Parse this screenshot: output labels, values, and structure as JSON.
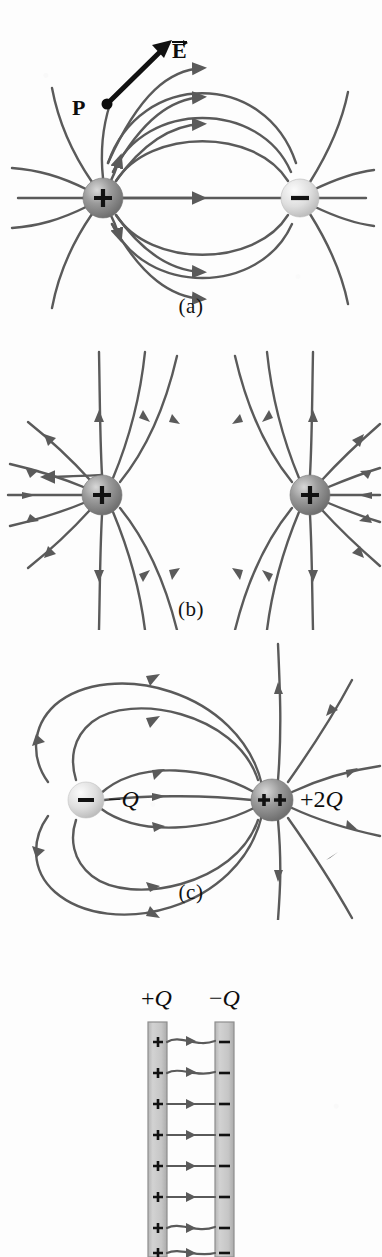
{
  "figure": {
    "background_color": "#fdfdfd",
    "field_line_color": "#5a5a5a",
    "label_color": "#0d0d0d"
  },
  "panels": [
    {
      "id": "a",
      "caption": "(a)",
      "description": "Electric dipole: equal and opposite point charges",
      "charges": [
        {
          "symbol": "+",
          "sign": "positive",
          "fill": "#8c8c8c",
          "x": 103,
          "y": 198,
          "r": 20
        },
        {
          "symbol": "−",
          "sign": "negative",
          "fill": "#d4d4d4",
          "x": 300,
          "y": 198,
          "r": 19
        }
      ],
      "annotations": [
        {
          "name": "point-P",
          "label": "P",
          "x": 80,
          "y": 108
        },
        {
          "name": "vector-E",
          "label": "E",
          "vector": true,
          "x": 176,
          "y": 45
        }
      ]
    },
    {
      "id": "b",
      "caption": "(b)",
      "description": "Two equal positive point charges",
      "charges": [
        {
          "symbol": "+",
          "sign": "positive",
          "fill": "#8c8c8c",
          "x": 102,
          "y": 495,
          "r": 20
        },
        {
          "symbol": "+",
          "sign": "positive",
          "fill": "#8c8c8c",
          "x": 310,
          "y": 495,
          "r": 20
        }
      ],
      "annotations": []
    },
    {
      "id": "c",
      "caption": "(c)",
      "description": "Unequal opposite charges: minus Q and plus two Q",
      "charges": [
        {
          "symbol": "−",
          "sign": "negative",
          "fill": "#e0e0e0",
          "x": 86,
          "y": 800,
          "r": 18
        },
        {
          "symbol": "++",
          "sign": "positive",
          "fill": "#6e6e6e",
          "x": 272,
          "y": 800,
          "r": 21
        }
      ],
      "annotations": [
        {
          "name": "charge-label-minus-q",
          "sign": "−",
          "value": "Q",
          "x": 110,
          "y": 786
        },
        {
          "name": "charge-label-plus-2q",
          "sign": "+2",
          "value": "Q",
          "x": 300,
          "y": 786
        }
      ]
    },
    {
      "id": "d",
      "caption": "",
      "description": "Parallel plate capacitor with oppositely charged plates",
      "plates": [
        {
          "name": "positive-plate",
          "label_sign": "+",
          "label_value": "Q",
          "sign_symbol": "+",
          "x": 148,
          "width": 19,
          "top": 1022,
          "fill": "#c9c9c9"
        },
        {
          "name": "negative-plate",
          "label_sign": "−",
          "label_value": "Q",
          "sign_symbol": "−",
          "x": 215,
          "width": 19,
          "top": 1022,
          "fill": "#c9c9c9"
        }
      ],
      "plate_charge_count": 8,
      "field_line_count": 8,
      "annotations": [
        {
          "name": "plate-label-plus-q",
          "sign": "+",
          "value": "Q",
          "x": 143,
          "y": 988
        },
        {
          "name": "plate-label-minus-q",
          "sign": "−",
          "value": "Q",
          "x": 211,
          "y": 988
        }
      ]
    }
  ]
}
